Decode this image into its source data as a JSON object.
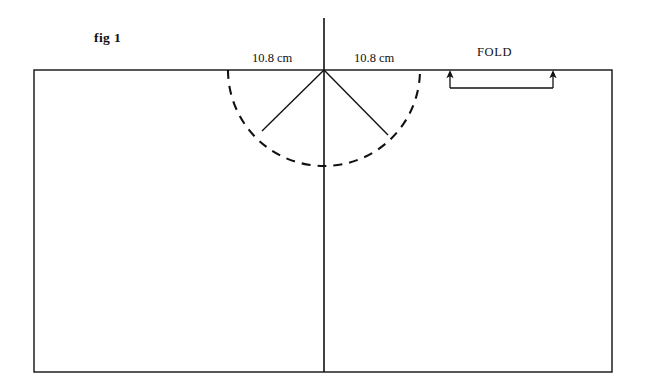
{
  "figure": {
    "caption": "fig 1",
    "background_color": "#ffffff",
    "ink_color": "#111111"
  },
  "labels": {
    "dimension_left": "10.8 cm",
    "dimension_right": "10.8 cm",
    "fold": "FOLD"
  },
  "geometry": {
    "panel_rect": {
      "x": 34,
      "y": 70,
      "width": 578,
      "height": 302
    },
    "center_fold_line": {
      "x": 324,
      "y_top": 18,
      "y_bottom": 372
    },
    "wedge_apex": {
      "x": 324,
      "y": 70
    },
    "arc_radius": 96,
    "arc_left_point": {
      "x": 228,
      "y": 70
    },
    "arc_right_point": {
      "x": 420,
      "y": 70
    },
    "arc_bottom_point": {
      "x": 324,
      "y": 172
    },
    "radial_left_end": {
      "x": 262,
      "y": 131
    },
    "radial_right_end": {
      "x": 388,
      "y": 135
    },
    "fold_bracket": {
      "x_left": 450,
      "x_right": 553,
      "y": 88,
      "arrow_tip_y": 71
    },
    "dash_pattern": "9 7"
  }
}
